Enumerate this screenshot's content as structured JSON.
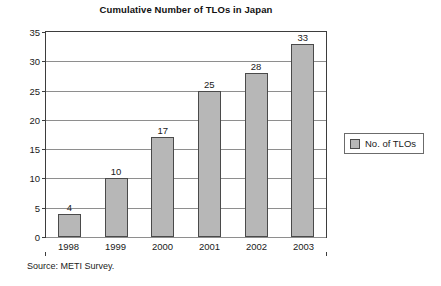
{
  "chart_data": {
    "type": "bar",
    "title": "Cumulative Number of TLOs in Japan",
    "categories": [
      "1998",
      "1999",
      "2000",
      "2001",
      "2002",
      "2003"
    ],
    "values": [
      4,
      10,
      17,
      25,
      28,
      33
    ],
    "series": [
      {
        "name": "No. of TLOs",
        "values": [
          4,
          10,
          17,
          25,
          28,
          33
        ]
      }
    ],
    "xlabel": "",
    "ylabel": "",
    "ylim": [
      0,
      35
    ],
    "ytick_step": 5,
    "yticks": [
      0,
      5,
      10,
      15,
      20,
      25,
      30,
      35
    ],
    "grid": true,
    "show_data_labels": true,
    "legend_position": "right",
    "bar_color": "#b7b7b7",
    "bar_border_color": "#4a4a4a",
    "gridline_color": "#8e8e8e",
    "axis_color": "#3d3d3d",
    "background_color": "#ffffff"
  },
  "legend": {
    "entries": [
      {
        "label": "No. of TLOs",
        "color": "#b7b7b7"
      }
    ]
  },
  "footer": {
    "source": "Source: METI Survey."
  }
}
